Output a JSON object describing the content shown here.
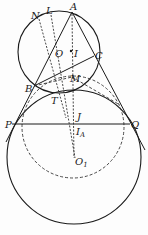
{
  "diagram": {
    "type": "geometry-figure",
    "colors": {
      "stroke": "#1a1a1a",
      "background": "#fdfdfd"
    },
    "circles": [
      {
        "name": "circumcircle",
        "center": "O",
        "cx": 59,
        "cy": 52,
        "r": 41,
        "style": "solid"
      },
      {
        "name": "mixtilinear-circle",
        "center": "O1",
        "cx": 74,
        "cy": 157,
        "r": 67,
        "style": "solid"
      },
      {
        "name": "dashed-circle",
        "cx": 73,
        "cy": 127,
        "r": 51,
        "style": "dashed"
      }
    ],
    "points": {
      "A": {
        "label": "A",
        "x": 72,
        "y": 12
      },
      "B": {
        "label": "B",
        "x": 34,
        "y": 86
      },
      "C": {
        "label": "C",
        "x": 94,
        "y": 56
      },
      "N": {
        "label": "N",
        "x": 38,
        "y": 13
      },
      "L": {
        "label": "L",
        "x": 51,
        "y": 11
      },
      "O": {
        "label": "O",
        "x": 58,
        "y": 52
      },
      "I": {
        "label": "I",
        "x": 71,
        "y": 52
      },
      "M": {
        "label": "M",
        "x": 72,
        "y": 80
      },
      "T": {
        "label": "T",
        "x": 56,
        "y": 98
      },
      "P": {
        "label": "P",
        "x": 12,
        "y": 124
      },
      "Q": {
        "label": "Q",
        "x": 128,
        "y": 124
      },
      "J": {
        "label": "J",
        "x": 74,
        "y": 124
      },
      "IA": {
        "label": "I",
        "sub": "A",
        "x": 74,
        "y": 132
      },
      "O1": {
        "label": "O",
        "sub": "1",
        "x": 74,
        "y": 161
      }
    }
  }
}
